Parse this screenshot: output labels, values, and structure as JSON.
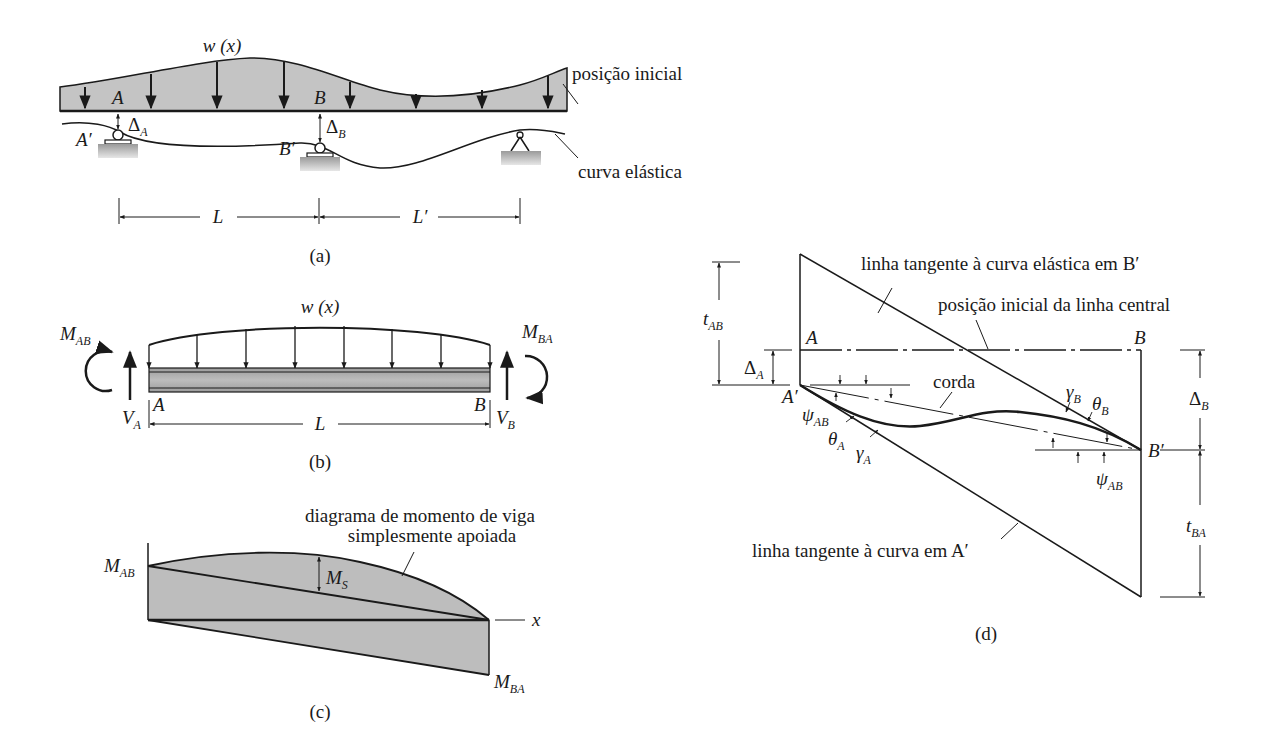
{
  "figure": {
    "panel_a": {
      "caption": "(a)",
      "load_label": "w (x)",
      "point_A": "A",
      "point_B": "B",
      "point_A_prime": "A′",
      "point_B_prime": "B′",
      "delta_A": "Δ",
      "delta_A_sub": "A",
      "delta_B": "Δ",
      "delta_B_sub": "B",
      "initial_position": "posição inicial",
      "elastic_curve": "curva elástica",
      "span_L": "L",
      "span_L_prime": "L′"
    },
    "panel_b": {
      "caption": "(b)",
      "load_label": "w (x)",
      "moment_AB": "M",
      "moment_AB_sub": "AB",
      "moment_BA": "M",
      "moment_BA_sub": "BA",
      "shear_A": "V",
      "shear_A_sub": "A",
      "shear_B": "V",
      "shear_B_sub": "B",
      "point_A": "A",
      "point_B": "B",
      "span_L": "L"
    },
    "panel_c": {
      "caption": "(c)",
      "moment_AB": "M",
      "moment_AB_sub": "AB",
      "moment_BA": "M",
      "moment_BA_sub": "BA",
      "moment_S": "M",
      "moment_S_sub": "S",
      "axis_x": "x",
      "diagram_note_line1": "diagrama de momento de viga",
      "diagram_note_line2": "simplesmente apoiada"
    },
    "panel_d": {
      "caption": "(d)",
      "tangent_B_label": "linha tangente à curva elástica em B′",
      "initial_centerline": "posição inicial da linha central",
      "chord": "corda",
      "tangent_A_label": "linha tangente à curva em A′",
      "point_A": "A",
      "point_B": "B",
      "point_A_prime": "A′",
      "point_B_prime": "B′",
      "t_AB": "t",
      "t_AB_sub": "AB",
      "t_BA": "t",
      "t_BA_sub": "BA",
      "delta_A": "Δ",
      "delta_A_sub": "A",
      "delta_B": "Δ",
      "delta_B_sub": "B",
      "psi_AB_left": "ψ",
      "psi_AB_left_sub": "AB",
      "psi_AB_right": "ψ",
      "psi_AB_right_sub": "AB",
      "theta_A": "θ",
      "theta_A_sub": "A",
      "gamma_A": "γ",
      "gamma_A_sub": "A",
      "theta_B": "θ",
      "theta_B_sub": "B",
      "gamma_B": "γ",
      "gamma_B_sub": "B"
    }
  }
}
